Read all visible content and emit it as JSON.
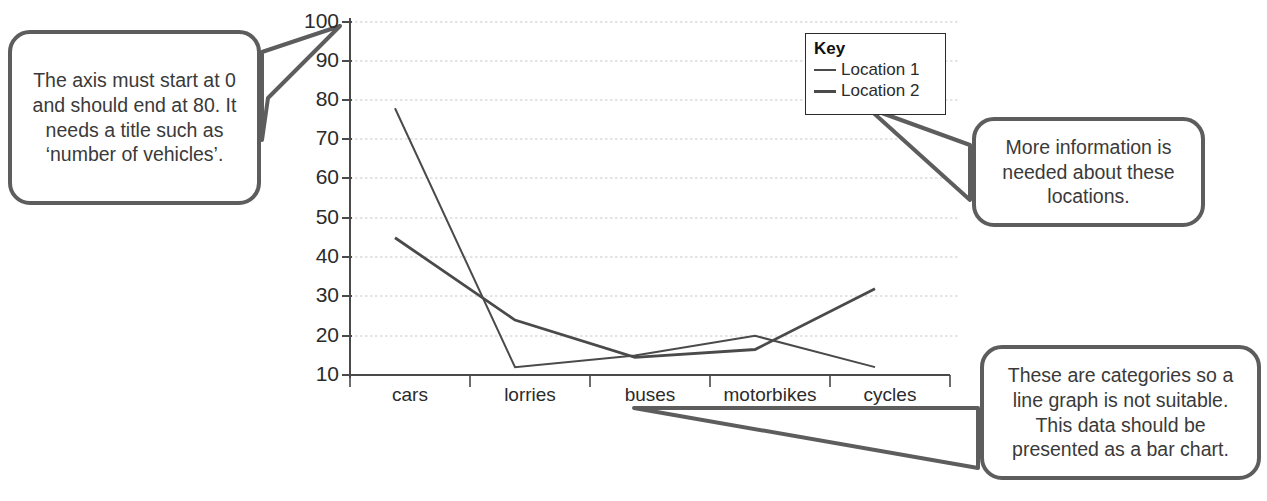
{
  "chart_data": {
    "type": "line",
    "title": "",
    "xlabel": "",
    "ylabel": "",
    "categories": [
      "cars",
      "lorries",
      "buses",
      "motorbikes",
      "cycles"
    ],
    "series": [
      {
        "name": "Location 1",
        "values": [
          78,
          12,
          15,
          20,
          12
        ]
      },
      {
        "name": "Location 2",
        "values": [
          45,
          24,
          14.5,
          16.5,
          32
        ]
      }
    ],
    "ylim": [
      10,
      100
    ],
    "yticks": [
      10,
      20,
      30,
      40,
      50,
      60,
      70,
      80,
      90,
      100
    ],
    "ytick_labels": [
      "10",
      "20",
      "30",
      "40",
      "50",
      "60",
      "70",
      "80",
      "90",
      "100"
    ],
    "grid": true,
    "legend_position": "inside-top-right",
    "line_color": "#4a4a4a",
    "grid_color": "#c9c9c9",
    "axis_color": "#4a4a4a"
  },
  "legend": {
    "title": "Key",
    "entries": [
      {
        "label": "Location 1",
        "style": "thin"
      },
      {
        "label": "Location 2",
        "style": "thick"
      }
    ]
  },
  "callouts": {
    "axis": "The axis must start at 0 and should end at 80. It needs a title such as ‘number of vehicles’.",
    "locations": "More information is needed about these locations.",
    "categories": "These are categories so a line graph is not suitable. This data should be presented as a bar chart."
  }
}
